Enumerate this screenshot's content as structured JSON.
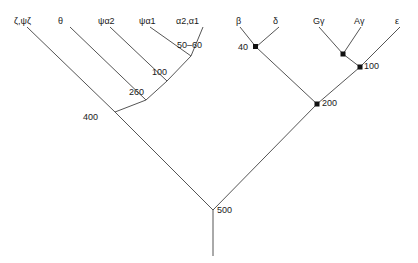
{
  "figure": {
    "type": "phylogenetic-tree",
    "background_color": "#ffffff",
    "line_color": "#555555",
    "node_marker_color": "#111111",
    "text_color": "#1a1a1a"
  },
  "left_tree": {
    "name": "alpha-globin-cluster",
    "tips": [
      {
        "label": "ζ,ψζ",
        "x": 22,
        "y": 22
      },
      {
        "label": "θ",
        "x": 61,
        "y": 22
      },
      {
        "label": "ψα2",
        "x": 103,
        "y": 22
      },
      {
        "label": "ψα1",
        "x": 143,
        "y": 22
      },
      {
        "label": "α2,α1",
        "x": 180,
        "y": 22
      }
    ],
    "nodes": [
      {
        "label": "50–60",
        "x": 181,
        "y": 47
      },
      {
        "label": "100",
        "x": 155,
        "y": 73
      },
      {
        "label": "260",
        "x": 133,
        "y": 93
      },
      {
        "label": "400",
        "x": 88,
        "y": 118
      }
    ]
  },
  "right_tree": {
    "name": "beta-globin-cluster",
    "tips": [
      {
        "label": "β",
        "x": 239,
        "y": 22
      },
      {
        "label": "δ",
        "x": 275,
        "y": 22
      },
      {
        "label": "Gγ",
        "x": 316,
        "y": 22
      },
      {
        "label": "Aγ",
        "x": 357,
        "y": 22
      },
      {
        "label": "ε",
        "x": 396,
        "y": 22
      }
    ],
    "nodes": [
      {
        "label": "40",
        "x": 244,
        "y": 48
      },
      {
        "label": "",
        "x": 343,
        "y": 60
      },
      {
        "label": "100",
        "x": 366,
        "y": 66
      },
      {
        "label": "200",
        "x": 323,
        "y": 106
      }
    ]
  },
  "root": {
    "label": "500",
    "x": 218,
    "y": 212
  }
}
